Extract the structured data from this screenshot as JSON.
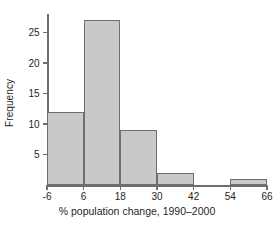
{
  "chart_data": {
    "type": "bar",
    "title": "",
    "subtitle": "",
    "xlabel": "% population change, 1990–2000",
    "ylabel": "Frequency",
    "categories": [
      "-6 to 6",
      "6 to 18",
      "18 to 30",
      "30 to 42",
      "42 to 54",
      "54 to 66"
    ],
    "bin_edges": [
      -6,
      6,
      18,
      30,
      42,
      54,
      66
    ],
    "values": [
      12,
      27,
      9,
      2,
      0,
      1
    ],
    "xlim": [
      -6,
      66
    ],
    "ylim": [
      0,
      28
    ],
    "xticks": [
      -6,
      6,
      18,
      30,
      42,
      54,
      66
    ],
    "xticklabels": [
      "-6",
      "6",
      "18",
      "30",
      "42",
      "54",
      "66"
    ],
    "yticks": [
      5,
      10,
      15,
      20,
      25
    ],
    "yticklabels": [
      "5",
      "10",
      "15",
      "20",
      "25"
    ],
    "grid": false,
    "legend": null,
    "annotations": [],
    "colors": {
      "bar_fill": "#c9c9c9",
      "bar_edge": "#6e6e6e",
      "axis": "#6e6e6e",
      "text": "#1f1f1f",
      "background": "#ffffff"
    }
  }
}
